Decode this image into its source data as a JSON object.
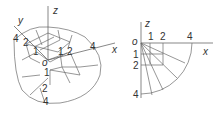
{
  "left_figure": {
    "description": "3D isometric grid of concentric boundaries on a curved surface",
    "axes": {
      "x": "x",
      "y": "y",
      "z": "z",
      "origin": "o"
    },
    "labels_y_axis": [
      "4",
      "2",
      "1"
    ],
    "labels_x_axis": [
      "1",
      "2",
      "4"
    ],
    "labels_z_axis": [
      "1",
      "2",
      "4"
    ]
  },
  "right_figure": {
    "description": "2D quarter-circle projection with radial lines",
    "axes": {
      "x": "x",
      "z": "z",
      "origin": "o"
    },
    "labels_x_axis": [
      "1",
      "2",
      "4"
    ],
    "labels_z_axis": [
      "1",
      "2",
      "4"
    ]
  },
  "colors": {
    "line": "#6a6a6a",
    "text": "#333333",
    "background": "#ffffff"
  }
}
